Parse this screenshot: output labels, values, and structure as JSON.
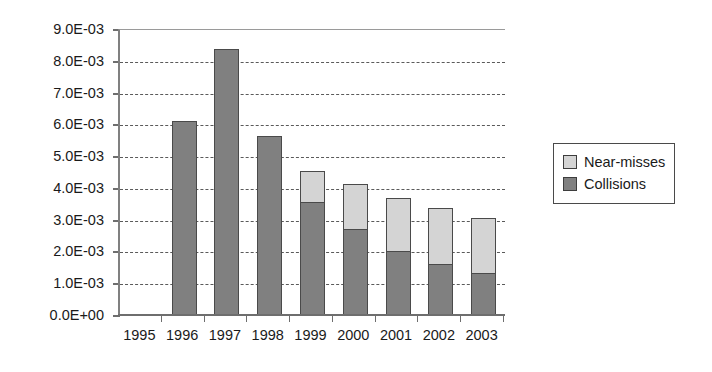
{
  "chart_data": {
    "type": "bar",
    "subtype": "stacked-vertical",
    "title": "",
    "subtitle": "",
    "xlabel": "",
    "ylabel": "",
    "categories": [
      "1995",
      "1996",
      "1997",
      "1998",
      "1999",
      "2000",
      "2001",
      "2002",
      "2003"
    ],
    "series": [
      {
        "name": "Collisions",
        "color": "#808080",
        "values": [
          0,
          0.00615,
          0.0084,
          0.00565,
          0.0036,
          0.00275,
          0.00205,
          0.00165,
          0.00135
        ]
      },
      {
        "name": "Near-misses",
        "color": "#d4d4d4",
        "values": [
          0,
          0,
          0,
          0,
          0.00095,
          0.0014,
          0.00165,
          0.00175,
          0.00175
        ]
      }
    ],
    "totals": [
      0,
      0.00615,
      0.0084,
      0.00565,
      0.00455,
      0.00415,
      0.0037,
      0.0034,
      0.0031
    ],
    "ylim": [
      0,
      0.009
    ],
    "ytick_values": [
      0,
      0.001,
      0.002,
      0.003,
      0.004,
      0.005,
      0.006,
      0.007,
      0.008,
      0.009
    ],
    "ytick_labels": [
      "0.0E+00",
      "1.0E-03",
      "2.0E-03",
      "3.0E-03",
      "4.0E-03",
      "5.0E-03",
      "6.0E-03",
      "7.0E-03",
      "8.0E-03",
      "9.0E-03"
    ],
    "grid": true,
    "grid_axis": "y",
    "grid_style": "dashed",
    "legend_position": "right",
    "legend_entries": [
      {
        "label": "Near-misses",
        "color": "#d4d4d4"
      },
      {
        "label": "Collisions",
        "color": "#808080"
      }
    ]
  },
  "legend": {
    "near_misses_label": "Near-misses",
    "collisions_label": "Collisions"
  },
  "colors": {
    "near_misses": "#d4d4d4",
    "collisions": "#808080",
    "axis": "#6e6e6e",
    "grid": "#5a5a5a",
    "text": "#1a1a1a",
    "background": "#ffffff"
  }
}
